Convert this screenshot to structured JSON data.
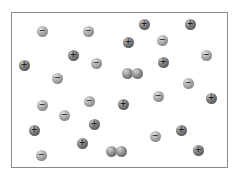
{
  "diagram": {
    "frame": {
      "x": 11,
      "y": 12,
      "width": 217,
      "height": 156,
      "border_color": "#8a8a8a"
    },
    "ions": [
      {
        "x": 42,
        "y": 31,
        "charge": "minus",
        "symbol": "−"
      },
      {
        "x": 88,
        "y": 31,
        "charge": "minus",
        "symbol": "−"
      },
      {
        "x": 144,
        "y": 24,
        "charge": "plus",
        "symbol": "+"
      },
      {
        "x": 190,
        "y": 24,
        "charge": "plus",
        "symbol": "+"
      },
      {
        "x": 128,
        "y": 42,
        "charge": "plus",
        "symbol": "+"
      },
      {
        "x": 162,
        "y": 40,
        "charge": "minus",
        "symbol": "−"
      },
      {
        "x": 73,
        "y": 55,
        "charge": "plus",
        "symbol": "+"
      },
      {
        "x": 96,
        "y": 63,
        "charge": "minus",
        "symbol": "−"
      },
      {
        "x": 206,
        "y": 55,
        "charge": "minus",
        "symbol": "−"
      },
      {
        "x": 24,
        "y": 65,
        "charge": "plus",
        "symbol": "+"
      },
      {
        "x": 57,
        "y": 78,
        "charge": "minus",
        "symbol": "−"
      },
      {
        "x": 163,
        "y": 62,
        "charge": "plus",
        "symbol": "+"
      },
      {
        "x": 127,
        "y": 73,
        "charge": "neutral",
        "symbol": ""
      },
      {
        "x": 137,
        "y": 73,
        "charge": "neutral",
        "symbol": ""
      },
      {
        "x": 188,
        "y": 83,
        "charge": "minus",
        "symbol": "−"
      },
      {
        "x": 42,
        "y": 105,
        "charge": "minus",
        "symbol": "−"
      },
      {
        "x": 89,
        "y": 101,
        "charge": "minus",
        "symbol": "−"
      },
      {
        "x": 64,
        "y": 115,
        "charge": "minus",
        "symbol": "−"
      },
      {
        "x": 123,
        "y": 104,
        "charge": "plus",
        "symbol": "+"
      },
      {
        "x": 158,
        "y": 96,
        "charge": "minus",
        "symbol": "−"
      },
      {
        "x": 211,
        "y": 98,
        "charge": "plus",
        "symbol": "+"
      },
      {
        "x": 34,
        "y": 130,
        "charge": "plus",
        "symbol": "+"
      },
      {
        "x": 94,
        "y": 124,
        "charge": "plus",
        "symbol": "+"
      },
      {
        "x": 181,
        "y": 130,
        "charge": "plus",
        "symbol": "+"
      },
      {
        "x": 155,
        "y": 136,
        "charge": "minus",
        "symbol": "−"
      },
      {
        "x": 82,
        "y": 143,
        "charge": "plus",
        "symbol": "+"
      },
      {
        "x": 41,
        "y": 155,
        "charge": "minus",
        "symbol": "−"
      },
      {
        "x": 111,
        "y": 151,
        "charge": "neutral",
        "symbol": ""
      },
      {
        "x": 121,
        "y": 151,
        "charge": "neutral",
        "symbol": ""
      },
      {
        "x": 198,
        "y": 150,
        "charge": "plus",
        "symbol": "+"
      }
    ]
  }
}
